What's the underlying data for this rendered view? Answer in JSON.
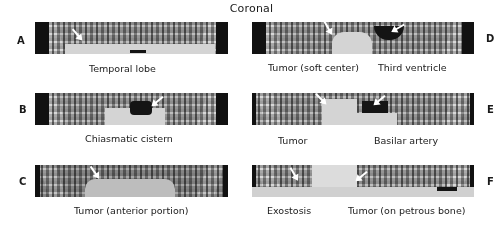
{
  "figure": {
    "title": "Coronal",
    "panels": [
      {
        "letter": "A",
        "captions": [
          "Temporal lobe"
        ]
      },
      {
        "letter": "B",
        "captions": [
          "Chiasmatic cistern"
        ]
      },
      {
        "letter": "C",
        "captions": [
          "Tumor (anterior portion)"
        ]
      },
      {
        "letter": "D",
        "captions": [
          "Tumor (soft center)",
          "Third ventricle"
        ]
      },
      {
        "letter": "E",
        "captions": [
          "Tumor",
          "Basilar artery"
        ]
      },
      {
        "letter": "F",
        "captions": [
          "Exostosis",
          "Tumor (on petrous bone)"
        ]
      }
    ],
    "colors": {
      "background": "#ffffff",
      "text": "#1a1a1a",
      "arrow": "#ffffff"
    }
  }
}
